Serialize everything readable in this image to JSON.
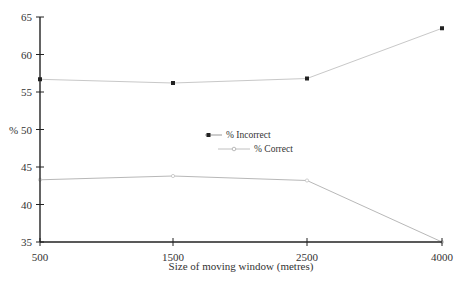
{
  "chart_data": {
    "type": "line",
    "title": "",
    "xlabel": "Size of moving window (metres)",
    "ylabel": "%",
    "categories": [
      "500",
      "1500",
      "2500",
      "4000"
    ],
    "x": [
      500,
      1500,
      2500,
      4000
    ],
    "ylim": [
      35,
      65
    ],
    "yticks": [
      35,
      40,
      45,
      50,
      55,
      60,
      65
    ],
    "ytick_labels": [
      "35",
      "40",
      "45",
      "% 50",
      "55",
      "60",
      "65"
    ],
    "grid": false,
    "legend_position": "center",
    "series": [
      {
        "name": "% Correct",
        "marker": "open-circle",
        "color": "#b8b8b8",
        "values": [
          43.3,
          43.8,
          43.2,
          35.0
        ]
      },
      {
        "name": "% Incorrect",
        "marker": "square",
        "color": "#c8c8c8",
        "marker_color": "#222222",
        "values": [
          56.7,
          56.2,
          56.8,
          63.5
        ]
      }
    ]
  },
  "legend": {
    "items": [
      {
        "label": "% Correct"
      },
      {
        "label": "% Incorrect"
      }
    ]
  }
}
